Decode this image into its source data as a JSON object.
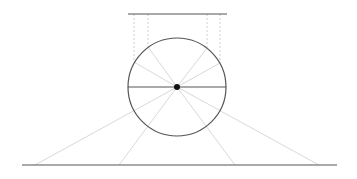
{
  "canvas": {
    "width": 357,
    "height": 179,
    "background": "#ffffff"
  },
  "colors": {
    "solid": "#555555",
    "ray": "#d9d9d9",
    "dashed": "#cfcfcf",
    "dot": "#111111"
  },
  "top_line": {
    "x1": 128,
    "y1": 14,
    "x2": 227,
    "y2": 14
  },
  "bottom_line": {
    "x1": 22,
    "y1": 165,
    "x2": 337,
    "y2": 165
  },
  "circle": {
    "cx": 177,
    "cy": 87,
    "r": 49
  },
  "diameter": {
    "x1": 128,
    "y1": 87,
    "x2": 226,
    "y2": 87
  },
  "center_dot": {
    "cx": 177,
    "cy": 87,
    "r": 3
  },
  "dashed_verticals": [
    {
      "x": 134,
      "y1": 14,
      "y2": 62
    },
    {
      "x": 148,
      "y1": 14,
      "y2": 47
    },
    {
      "x": 207,
      "y1": 14,
      "y2": 48
    },
    {
      "x": 220,
      "y1": 14,
      "y2": 63
    }
  ],
  "upper_rays": [
    {
      "x1": 177,
      "y1": 87,
      "x2": 134,
      "y2": 62
    },
    {
      "x1": 177,
      "y1": 87,
      "x2": 148,
      "y2": 47
    },
    {
      "x1": 177,
      "y1": 87,
      "x2": 207,
      "y2": 48
    },
    {
      "x1": 177,
      "y1": 87,
      "x2": 220,
      "y2": 63
    }
  ],
  "lower_rays": [
    {
      "x1": 177,
      "y1": 87,
      "x2": 35,
      "y2": 165
    },
    {
      "x1": 177,
      "y1": 87,
      "x2": 119,
      "y2": 165
    },
    {
      "x1": 177,
      "y1": 87,
      "x2": 235,
      "y2": 165
    },
    {
      "x1": 177,
      "y1": 87,
      "x2": 319,
      "y2": 165
    }
  ]
}
